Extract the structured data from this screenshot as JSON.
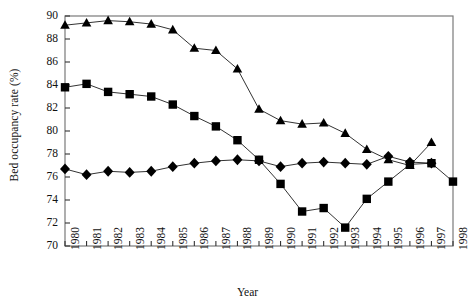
{
  "chart_data": {
    "type": "line",
    "title": "",
    "xlabel": "Year",
    "ylabel": "Bed occupancy rate (%)",
    "x": [
      1980,
      1981,
      1982,
      1983,
      1984,
      1985,
      1986,
      1987,
      1988,
      1989,
      1990,
      1991,
      1992,
      1993,
      1994,
      1995,
      1996,
      1997,
      1998
    ],
    "xlim": [
      1980,
      1998
    ],
    "ylim": [
      70,
      90
    ],
    "yticks": [
      70,
      72,
      74,
      76,
      78,
      80,
      82,
      84,
      86,
      88,
      90
    ],
    "xticks": [
      "1980",
      "1981",
      "1982",
      "1983",
      "1984",
      "1985",
      "1986",
      "1987",
      "1988",
      "1989",
      "1990",
      "1991",
      "1992",
      "1993",
      "1994",
      "1995",
      "1996",
      "1997",
      "1998"
    ],
    "grid": false,
    "legend": "none",
    "line_color": "#333333",
    "marker_color": "#000000",
    "series": [
      {
        "name": "triangle-series",
        "marker": "triangle",
        "values": [
          89.2,
          89.4,
          89.6,
          89.5,
          89.3,
          88.8,
          87.2,
          87.0,
          85.4,
          81.9,
          80.9,
          80.6,
          80.7,
          79.8,
          78.4,
          77.5,
          77.0,
          79.0,
          null
        ]
      },
      {
        "name": "square-series",
        "marker": "square",
        "values": [
          83.8,
          84.1,
          83.4,
          83.2,
          83.0,
          82.3,
          81.3,
          80.4,
          79.2,
          77.5,
          75.4,
          73.0,
          73.3,
          71.6,
          74.1,
          75.6,
          77.1,
          77.2,
          75.6
        ]
      },
      {
        "name": "diamond-series",
        "marker": "diamond",
        "values": [
          76.7,
          76.2,
          76.5,
          76.4,
          76.5,
          76.9,
          77.2,
          77.4,
          77.5,
          77.4,
          76.9,
          77.2,
          77.3,
          77.2,
          77.1,
          77.8,
          77.3,
          77.2,
          null
        ]
      }
    ]
  }
}
